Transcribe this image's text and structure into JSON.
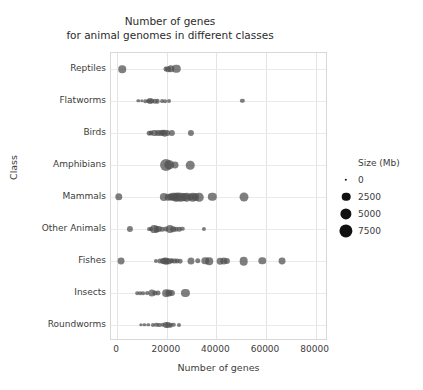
{
  "chart_data": {
    "type": "scatter",
    "title": "Number of genes\nfor animal genomes in different classes",
    "title_lines": [
      "Number of genes",
      "for animal genomes in different classes"
    ],
    "xlabel": "Number of genes",
    "ylabel": "Class",
    "xlim": [
      -2500,
      85000
    ],
    "xticks": [
      0,
      20000,
      40000,
      60000,
      80000
    ],
    "xtick_labels": [
      "0",
      "20000",
      "40000",
      "60000",
      "80000"
    ],
    "categories": [
      "Reptiles",
      "Flatworms",
      "Birds",
      "Amphibians",
      "Mammals",
      "Other Animals",
      "Fishes",
      "Insects",
      "Roundworms"
    ],
    "grid": true,
    "marker_color": "#4d4d4d",
    "marker_opacity": 0.72,
    "size_encoding": "Size (Mb)",
    "legend": {
      "title": "Size (Mb)",
      "position": "right",
      "entries": [
        {
          "label": "0",
          "value": 0,
          "radius_px": 1.2
        },
        {
          "label": "2500",
          "value": 2500,
          "radius_px": 4.3
        },
        {
          "label": "5000",
          "value": 5000,
          "radius_px": 5.6
        },
        {
          "label": "7500",
          "value": 7500,
          "radius_px": 6.6
        }
      ]
    },
    "series": [
      {
        "name": "Reptiles",
        "points": [
          {
            "genes": 2000,
            "size": 1700
          },
          {
            "genes": 19500,
            "size": 400
          },
          {
            "genes": 20500,
            "size": 700
          },
          {
            "genes": 21500,
            "size": 1600
          },
          {
            "genes": 23800,
            "size": 2300
          }
        ]
      },
      {
        "name": "Flatworms",
        "points": [
          {
            "genes": 8500,
            "size": 60
          },
          {
            "genes": 9800,
            "size": 60
          },
          {
            "genes": 11200,
            "size": 90
          },
          {
            "genes": 12400,
            "size": 120
          },
          {
            "genes": 13200,
            "size": 900
          },
          {
            "genes": 13900,
            "size": 500
          },
          {
            "genes": 15400,
            "size": 300
          },
          {
            "genes": 16300,
            "size": 350
          },
          {
            "genes": 18200,
            "size": 120
          },
          {
            "genes": 19400,
            "size": 110
          },
          {
            "genes": 21000,
            "size": 150
          },
          {
            "genes": 50500,
            "size": 230
          }
        ]
      },
      {
        "name": "Birds",
        "points": [
          {
            "genes": 12800,
            "size": 350
          },
          {
            "genes": 13600,
            "size": 400
          },
          {
            "genes": 15000,
            "size": 900
          },
          {
            "genes": 16300,
            "size": 850
          },
          {
            "genes": 17600,
            "size": 900
          },
          {
            "genes": 18400,
            "size": 1000
          },
          {
            "genes": 19200,
            "size": 1100
          },
          {
            "genes": 20300,
            "size": 800
          },
          {
            "genes": 22000,
            "size": 950
          },
          {
            "genes": 29800,
            "size": 900
          }
        ]
      },
      {
        "name": "Amphibians",
        "points": [
          {
            "genes": 19800,
            "size": 5800
          },
          {
            "genes": 21000,
            "size": 3200
          },
          {
            "genes": 23300,
            "size": 1300
          },
          {
            "genes": 29400,
            "size": 2400
          }
        ]
      },
      {
        "name": "Mammals",
        "points": [
          {
            "genes": 700,
            "size": 1600
          },
          {
            "genes": 18900,
            "size": 2200
          },
          {
            "genes": 20600,
            "size": 1100
          },
          {
            "genes": 21600,
            "size": 1500
          },
          {
            "genes": 22600,
            "size": 2300
          },
          {
            "genes": 23600,
            "size": 2400
          },
          {
            "genes": 24600,
            "size": 2600
          },
          {
            "genes": 25700,
            "size": 2500
          },
          {
            "genes": 26900,
            "size": 1900
          },
          {
            "genes": 28000,
            "size": 2500
          },
          {
            "genes": 29200,
            "size": 1300
          },
          {
            "genes": 30400,
            "size": 2400
          },
          {
            "genes": 31600,
            "size": 1900
          },
          {
            "genes": 33000,
            "size": 2400
          },
          {
            "genes": 38300,
            "size": 2300
          },
          {
            "genes": 51000,
            "size": 2800
          }
        ]
      },
      {
        "name": "Other Animals",
        "points": [
          {
            "genes": 5100,
            "size": 900
          },
          {
            "genes": 12800,
            "size": 120
          },
          {
            "genes": 13800,
            "size": 140
          },
          {
            "genes": 15000,
            "size": 1900
          },
          {
            "genes": 15900,
            "size": 1200
          },
          {
            "genes": 16800,
            "size": 900
          },
          {
            "genes": 18200,
            "size": 300
          },
          {
            "genes": 19600,
            "size": 500
          },
          {
            "genes": 21200,
            "size": 2200
          },
          {
            "genes": 22500,
            "size": 700
          },
          {
            "genes": 23800,
            "size": 350
          },
          {
            "genes": 25000,
            "size": 300
          },
          {
            "genes": 26200,
            "size": 250
          },
          {
            "genes": 34900,
            "size": 200
          }
        ]
      },
      {
        "name": "Fishes",
        "points": [
          {
            "genes": 1500,
            "size": 1300
          },
          {
            "genes": 15500,
            "size": 200
          },
          {
            "genes": 17200,
            "size": 500
          },
          {
            "genes": 18400,
            "size": 800
          },
          {
            "genes": 19200,
            "size": 1400
          },
          {
            "genes": 20000,
            "size": 1100
          },
          {
            "genes": 21000,
            "size": 700
          },
          {
            "genes": 22000,
            "size": 600
          },
          {
            "genes": 23100,
            "size": 500
          },
          {
            "genes": 24200,
            "size": 400
          },
          {
            "genes": 25400,
            "size": 350
          },
          {
            "genes": 29800,
            "size": 1400
          },
          {
            "genes": 32500,
            "size": 600
          },
          {
            "genes": 35500,
            "size": 1600
          },
          {
            "genes": 37000,
            "size": 1700
          },
          {
            "genes": 41500,
            "size": 1200
          },
          {
            "genes": 43000,
            "size": 1500
          },
          {
            "genes": 44300,
            "size": 900
          },
          {
            "genes": 51000,
            "size": 2500
          },
          {
            "genes": 58500,
            "size": 1600
          },
          {
            "genes": 66500,
            "size": 1300
          }
        ]
      },
      {
        "name": "Insects",
        "points": [
          {
            "genes": 8000,
            "size": 100
          },
          {
            "genes": 9200,
            "size": 90
          },
          {
            "genes": 10600,
            "size": 110
          },
          {
            "genes": 12000,
            "size": 130
          },
          {
            "genes": 14000,
            "size": 1500
          },
          {
            "genes": 15300,
            "size": 500
          },
          {
            "genes": 16500,
            "size": 400
          },
          {
            "genes": 19600,
            "size": 1800
          },
          {
            "genes": 21000,
            "size": 1400
          },
          {
            "genes": 22000,
            "size": 900
          },
          {
            "genes": 27500,
            "size": 2100
          }
        ]
      },
      {
        "name": "Roundworms",
        "points": [
          {
            "genes": 9500,
            "size": 60
          },
          {
            "genes": 11000,
            "size": 70
          },
          {
            "genes": 12500,
            "size": 70
          },
          {
            "genes": 14500,
            "size": 200
          },
          {
            "genes": 15800,
            "size": 230
          },
          {
            "genes": 17000,
            "size": 220
          },
          {
            "genes": 18500,
            "size": 260
          },
          {
            "genes": 19600,
            "size": 900
          },
          {
            "genes": 20400,
            "size": 800
          },
          {
            "genes": 21600,
            "size": 300
          },
          {
            "genes": 22600,
            "size": 250
          },
          {
            "genes": 25000,
            "size": 180
          }
        ]
      }
    ]
  }
}
